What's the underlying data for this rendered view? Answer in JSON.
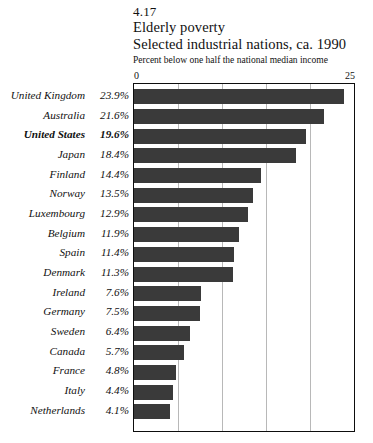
{
  "header": {
    "figure_number": "4.17",
    "title": "Elderly poverty",
    "subtitle": "Selected industrial nations, ca. 1990",
    "note": "Percent below one half the national median income"
  },
  "axis": {
    "min_label": "0",
    "max_label": "25"
  },
  "chart_data": {
    "type": "bar",
    "orientation": "horizontal",
    "title": "Elderly poverty",
    "subtitle": "Selected industrial nations, ca. 1990",
    "figure_number": "4.17",
    "xlabel": "Percent below one half the national median income",
    "ylabel": "",
    "xlim": [
      0,
      25
    ],
    "xticks": [
      0,
      25
    ],
    "gridlines": [
      5,
      10,
      15,
      20
    ],
    "grid": true,
    "legend": "none",
    "bar_color": "#3a3a3a",
    "highlight_category": "United States",
    "categories": [
      "United Kingdom",
      "Australia",
      "United States",
      "Japan",
      "Finland",
      "Norway",
      "Luxembourg",
      "Belgium",
      "Spain",
      "Denmark",
      "Ireland",
      "Germany",
      "Sweden",
      "Canada",
      "France",
      "Italy",
      "Netherlands"
    ],
    "values": [
      23.9,
      21.6,
      19.6,
      18.4,
      14.4,
      13.5,
      12.9,
      11.9,
      11.4,
      11.3,
      7.6,
      7.5,
      6.4,
      5.7,
      4.8,
      4.4,
      4.1
    ],
    "value_labels": [
      "23.9%",
      "21.6%",
      "19.6%",
      "18.4%",
      "14.4%",
      "13.5%",
      "12.9%",
      "11.9%",
      "11.4%",
      "11.3%",
      "7.6%",
      "7.5%",
      "6.4%",
      "5.7%",
      "4.8%",
      "4.4%",
      "4.1%"
    ]
  }
}
